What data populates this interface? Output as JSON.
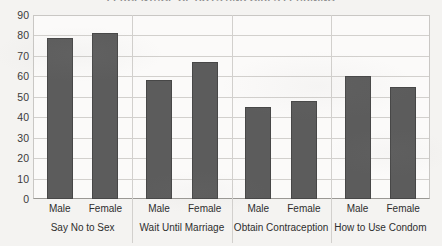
{
  "chart_data": {
    "type": "bar",
    "title": "PERCENTAGE OF BOYS AND GIRLS LEARNING",
    "xlabel": "",
    "ylabel": "",
    "ylim": [
      0,
      90
    ],
    "ytick_step": 10,
    "yticks": [
      90,
      80,
      70,
      60,
      50,
      40,
      30,
      20,
      10,
      0
    ],
    "grid": true,
    "legend": "none",
    "categories": [
      "Say No to Sex",
      "Wait Until Marriage",
      "Obtain Contraception",
      "How to Use Condom"
    ],
    "series": [
      {
        "name": "Male",
        "values": [
          79,
          58,
          45,
          60
        ]
      },
      {
        "name": "Female",
        "values": [
          81,
          67,
          48,
          55
        ]
      }
    ],
    "bars": [
      {
        "group": "Say No to Sex",
        "series": "Male",
        "value": 79
      },
      {
        "group": "Say No to Sex",
        "series": "Female",
        "value": 81
      },
      {
        "group": "Wait Until Marriage",
        "series": "Male",
        "value": 58
      },
      {
        "group": "Wait Until Marriage",
        "series": "Female",
        "value": 67
      },
      {
        "group": "Obtain Contraception",
        "series": "Male",
        "value": 45
      },
      {
        "group": "Obtain Contraception",
        "series": "Female",
        "value": 48
      },
      {
        "group": "How to Use Condom",
        "series": "Male",
        "value": 60
      },
      {
        "group": "How to Use Condom",
        "series": "Female",
        "value": 55
      }
    ],
    "colors": {
      "bar_fill": "#5c5c5c",
      "bar_stroke": "#474747",
      "gridline": "#d2d0cd",
      "axis": "#9a9894",
      "background": "#f4f3f1",
      "plot_background": "#fbfaf9",
      "text": "#2e2e2e"
    }
  }
}
